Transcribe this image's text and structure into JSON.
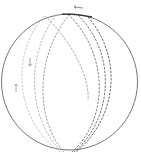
{
  "diagram": {
    "type": "sphere-with-great-circle-arcs",
    "background": "#ffffff",
    "outline_color": "#555555",
    "arc_colors": [
      "#aaaaaa",
      "#999999",
      "#777777",
      "#555555",
      "#444444"
    ],
    "arc_count": 5,
    "arrows": [
      {
        "position": "top",
        "direction": "left"
      },
      {
        "position": "left-upper",
        "direction": "down"
      },
      {
        "position": "left-lower",
        "direction": "up"
      }
    ],
    "labels": []
  }
}
